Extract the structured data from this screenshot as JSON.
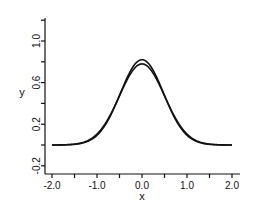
{
  "chart_data": {
    "type": "line",
    "title": "",
    "xlabel": "x",
    "ylabel": "y",
    "xlim": [
      -2.1,
      2.2
    ],
    "ylim": [
      -0.25,
      1.25
    ],
    "x_ticks": [
      -2.0,
      -1.5,
      -1.0,
      -0.5,
      0.0,
      0.5,
      1.0,
      1.5,
      2.0
    ],
    "x_tick_labels": [
      "-2.0",
      "-1.0",
      "0.0",
      "1.0",
      "2.0"
    ],
    "x_tick_label_values": [
      -2.0,
      -1.0,
      0.0,
      1.0,
      2.0
    ],
    "y_ticks": [
      -0.2,
      0.0,
      0.2,
      0.4,
      0.6,
      0.8,
      1.0,
      1.2
    ],
    "y_tick_labels": [
      "-0.2",
      "0.2",
      "0.6",
      "1.0"
    ],
    "y_tick_label_values": [
      -0.2,
      0.2,
      0.6,
      1.0
    ],
    "grid": false,
    "legend": null,
    "series": [
      {
        "name": "curve 1",
        "peak": 0.82,
        "sigma": 0.48,
        "x": [
          -2.0,
          -1.5,
          -1.25,
          -1.0,
          -0.75,
          -0.5,
          -0.25,
          0.0,
          0.25,
          0.5,
          0.75,
          1.0,
          1.25,
          1.5,
          2.0
        ],
        "values": [
          0.0,
          0.01,
          0.03,
          0.09,
          0.24,
          0.48,
          0.72,
          0.82,
          0.72,
          0.48,
          0.24,
          0.09,
          0.03,
          0.01,
          0.0
        ]
      },
      {
        "name": "curve 2",
        "peak": 0.78,
        "sigma": 0.5,
        "x": [
          -2.0,
          -1.5,
          -1.25,
          -1.0,
          -0.75,
          -0.5,
          -0.25,
          0.0,
          0.25,
          0.5,
          0.75,
          1.0,
          1.25,
          1.5,
          2.0
        ],
        "values": [
          0.0,
          0.01,
          0.03,
          0.1,
          0.25,
          0.47,
          0.69,
          0.78,
          0.69,
          0.47,
          0.25,
          0.1,
          0.03,
          0.01,
          0.0
        ]
      }
    ]
  }
}
